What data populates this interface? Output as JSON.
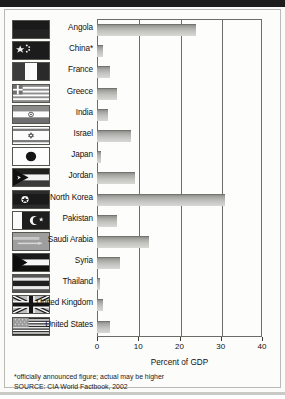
{
  "chart_data": {
    "type": "bar",
    "orientation": "horizontal",
    "title": "",
    "xlabel": "Percent of GDP",
    "ylabel": "",
    "xlim": [
      0,
      40
    ],
    "xticks": [
      0,
      10,
      20,
      30,
      40
    ],
    "grid": true,
    "legend": false,
    "categories": [
      "Angola",
      "China*",
      "France",
      "Greece",
      "India",
      "Israel",
      "Japan",
      "Jordan",
      "North Korea",
      "Pakistan",
      "Saudi Arabia",
      "Syria",
      "Thailand",
      "United Kingdom",
      "United States"
    ],
    "values": [
      24.0,
      1.5,
      3.2,
      4.8,
      2.6,
      8.3,
      1.0,
      9.3,
      31.0,
      4.9,
      12.7,
      5.6,
      0.7,
      1.5,
      3.2
    ],
    "annotations": [
      "*officially announced figure; actual may be higher",
      "SOURCE: CIA World Factbook, 2002"
    ]
  },
  "axis": {
    "title": "Percent of GDP",
    "tick_labels": [
      "0",
      "10",
      "20",
      "30",
      "40"
    ]
  },
  "rows": [
    {
      "label": "Angola",
      "value": 24.0,
      "flag": "angola-flag-icon"
    },
    {
      "label": "China*",
      "value": 1.5,
      "flag": "china-flag-icon"
    },
    {
      "label": "France",
      "value": 3.2,
      "flag": "france-flag-icon"
    },
    {
      "label": "Greece",
      "value": 4.8,
      "flag": "greece-flag-icon"
    },
    {
      "label": "India",
      "value": 2.6,
      "flag": "india-flag-icon"
    },
    {
      "label": "Israel",
      "value": 8.3,
      "flag": "israel-flag-icon"
    },
    {
      "label": "Japan",
      "value": 1.0,
      "flag": "japan-flag-icon"
    },
    {
      "label": "Jordan",
      "value": 9.3,
      "flag": "jordan-flag-icon"
    },
    {
      "label": "North Korea",
      "value": 31.0,
      "flag": "north-korea-flag-icon"
    },
    {
      "label": "Pakistan",
      "value": 4.9,
      "flag": "pakistan-flag-icon"
    },
    {
      "label": "Saudi Arabia",
      "value": 12.7,
      "flag": "saudi-arabia-flag-icon"
    },
    {
      "label": "Syria",
      "value": 5.6,
      "flag": "syria-flag-icon"
    },
    {
      "label": "Thailand",
      "value": 0.7,
      "flag": "thailand-flag-icon"
    },
    {
      "label": "United Kingdom",
      "value": 1.5,
      "flag": "united-kingdom-flag-icon"
    },
    {
      "label": "United States",
      "value": 3.2,
      "flag": "united-states-flag-icon"
    }
  ],
  "notes": {
    "footnote": "*officially announced figure; actual may be higher",
    "source": "SOURCE: CIA World Factbook, 2002"
  },
  "colors": {
    "bar_dark": "#8f8f8c",
    "bar_light": "#d8d8d5",
    "axis": "#6d6d68",
    "page_bg": "#fbfbfa",
    "header_bar": "#1c1c1c"
  }
}
